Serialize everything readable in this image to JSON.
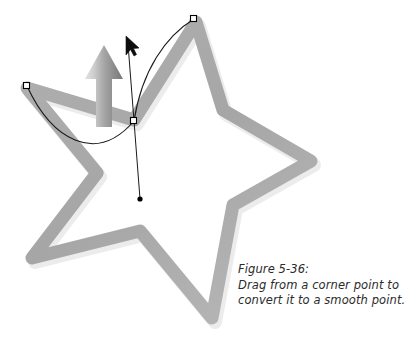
{
  "figure": {
    "name": "figure-5-36-star-pen-tool",
    "caption": {
      "label": "Figure 5-36:",
      "line1": "Drag from a corner point to",
      "line2": "convert it to a smooth point."
    },
    "colors": {
      "background": "#ffffff",
      "star_stroke": "#a9a9a9",
      "star_stroke_shadow": "#c4c4c4",
      "arrow_light": "#d4d4d4",
      "arrow_dark": "#767676",
      "path_line": "#1a1a1a",
      "anchor_fill": "#ffffff",
      "anchor_stroke": "#000000",
      "handle_dot": "#000000",
      "caption_text": "#2b2b2b"
    },
    "shapes": {
      "star": {
        "name": "five-pointed-star-outline",
        "stroke_width": 13,
        "points": [
          [
            196,
            22
          ],
          [
            223,
            110
          ],
          [
            311,
            161
          ],
          [
            233,
            205
          ],
          [
            212,
            318
          ],
          [
            140,
            231
          ],
          [
            32,
            258
          ],
          [
            97,
            173
          ],
          [
            27,
            88
          ],
          [
            134,
            120
          ]
        ]
      },
      "gray_arrow": {
        "name": "drag-direction-arrow",
        "tip": [
          104,
          45
        ],
        "tail": [
          104,
          127
        ],
        "head_width": 38,
        "head_height": 34,
        "shaft_width": 16
      }
    },
    "path": {
      "name": "bezier-path-segment",
      "anchors": [
        {
          "name": "anchor-left-corner",
          "x": 27,
          "y": 86,
          "type": "corner",
          "selected": true
        },
        {
          "name": "anchor-center-smooth",
          "x": 134,
          "y": 121,
          "type": "smooth",
          "selected": true
        },
        {
          "name": "anchor-top-right-corner",
          "x": 194,
          "y": 19,
          "type": "corner",
          "selected": true
        }
      ],
      "handles": [
        {
          "name": "direction-handle-down",
          "from": [
            134,
            121
          ],
          "to": [
            140,
            199
          ],
          "dot": true
        },
        {
          "name": "direction-handle-up",
          "from": [
            134,
            121
          ],
          "to": [
            128,
            44
          ],
          "dot": false
        }
      ],
      "curves": [
        {
          "name": "curve-left-segment",
          "start": [
            27,
            86
          ],
          "c1": [
            52,
            140
          ],
          "c2": [
            96,
            165
          ],
          "end": [
            134,
            121
          ]
        },
        {
          "name": "curve-right-segment",
          "start": [
            134,
            121
          ],
          "c1": [
            142,
            70
          ],
          "c2": [
            166,
            36
          ],
          "end": [
            194,
            19
          ]
        }
      ]
    },
    "cursor": {
      "name": "arrow-pointer-cursor",
      "x": 124,
      "y": 38,
      "width": 13,
      "height": 19
    }
  }
}
